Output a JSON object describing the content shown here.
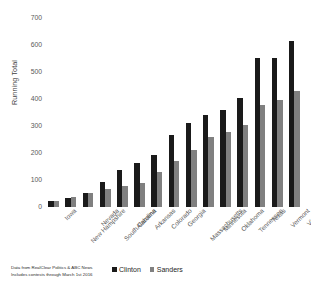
{
  "chart_data": {
    "type": "bar",
    "title": "",
    "xlabel": "",
    "ylabel": "Running Total",
    "ylim": [
      0,
      700
    ],
    "yticks": [
      0,
      100,
      200,
      300,
      400,
      500,
      600,
      700
    ],
    "grid": false,
    "legend_position": "bottom-center",
    "categories": [
      "Iowa",
      "New Hampshire",
      "Nevada",
      "South Carolina",
      "Alabama",
      "Arkansas",
      "Colorado",
      "Georgia",
      "Massachusetts",
      "Minnesota",
      "Oklahoma",
      "Tennessee",
      "Texas",
      "Vermont",
      "Virginia"
    ],
    "series": [
      {
        "name": "Clinton",
        "color": "#1a1a1a",
        "values": [
          23,
          32,
          52,
          91,
          136,
          163,
          191,
          268,
          311,
          341,
          360,
          404,
          553,
          553,
          614
        ]
      },
      {
        "name": "Sanders",
        "color": "#808080",
        "values": [
          21,
          36,
          52,
          68,
          76,
          89,
          130,
          169,
          213,
          259,
          279,
          303,
          377,
          395,
          429
        ]
      }
    ]
  },
  "axis": {
    "y_title": "Running Total",
    "y_tick_labels": [
      "0",
      "100",
      "200",
      "300",
      "400",
      "500",
      "600",
      "700"
    ]
  },
  "legend": {
    "items": [
      {
        "label": "Clinton",
        "color": "#1a1a1a",
        "swatch": "square-black-icon"
      },
      {
        "label": "Sanders",
        "color": "#808080",
        "swatch": "square-gray-icon"
      }
    ]
  },
  "footer": {
    "source_line_1": "Data from RealClear Politics & ABC News",
    "source_line_2": "Includes contests through March 1st 2016"
  }
}
